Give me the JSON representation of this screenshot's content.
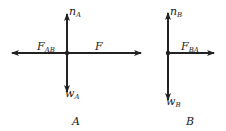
{
  "diagrams": [
    {
      "caption": "A",
      "labels": {
        "up": "n",
        "up_sub": "A",
        "left": "F",
        "left_sub": "AB",
        "right": "F",
        "right_sub": "",
        "down": "w",
        "down_sub": "A"
      }
    },
    {
      "caption": "B",
      "labels": {
        "up": "n",
        "up_sub": "B",
        "right": "F",
        "right_sub": "BA",
        "down": "w",
        "down_sub": "B"
      }
    }
  ],
  "colors": {
    "stroke": "#222222",
    "background": "#ffffff"
  }
}
